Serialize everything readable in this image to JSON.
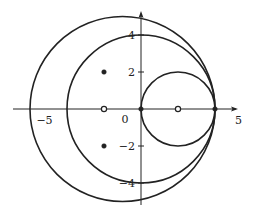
{
  "diagram": {
    "type": "complex-plane-circles",
    "axes": {
      "x_range": [
        -7,
        5.5
      ],
      "y_range": [
        -5.2,
        5.3
      ],
      "x_tick_labels": [
        {
          "value": -5,
          "label": "−5"
        },
        {
          "value": 5,
          "label": "5"
        }
      ],
      "y_tick_labels": [
        {
          "value": 4,
          "label": "4"
        },
        {
          "value": 2,
          "label": "2"
        },
        {
          "value": -2,
          "label": "−2"
        },
        {
          "value": -4,
          "label": "−4"
        }
      ],
      "origin_label": "0"
    },
    "circles": [
      {
        "name": "outer-circle",
        "center": [
          -1,
          0
        ],
        "radius": 5
      },
      {
        "name": "middle-circle",
        "center": [
          0,
          0
        ],
        "radius": 4
      },
      {
        "name": "small-circle",
        "center": [
          2,
          0
        ],
        "radius": 2
      }
    ],
    "points": [
      {
        "name": "filled-point-upper",
        "x": -2,
        "y": 2,
        "filled": true
      },
      {
        "name": "filled-point-lower",
        "x": -2,
        "y": -2,
        "filled": true
      },
      {
        "name": "open-point-left",
        "x": -2,
        "y": 0,
        "filled": false
      },
      {
        "name": "open-point-right",
        "x": 2,
        "y": 0,
        "filled": false
      },
      {
        "name": "filled-point-origin",
        "x": 0,
        "y": 0,
        "filled": true
      },
      {
        "name": "filled-point-four",
        "x": 4,
        "y": 0,
        "filled": true
      }
    ],
    "colors": {
      "stroke": "#222222",
      "background": "#ffffff"
    }
  }
}
